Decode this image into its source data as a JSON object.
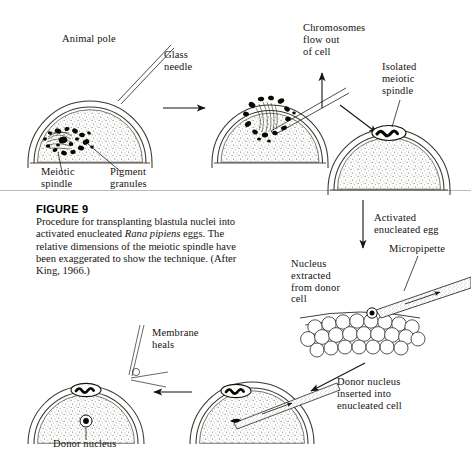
{
  "figure": {
    "title": "FIGURE 9",
    "caption_part1": "Procedure for transplanting blastula nuclei into activated enucleated ",
    "caption_italic1": "Rana",
    "caption_part2": " ",
    "caption_italic2": "pipiens",
    "caption_part3": " eggs. The relative dimensions of the meiotic spindle have been exaggerated to show the technique. (After King, 1966.)"
  },
  "labels": {
    "animal_pole": "Animal pole",
    "glass_needle": "Glass\nneedle",
    "meiotic_spindle": "Meiotic\nspindle",
    "pigment_granules": "Pigment\ngranules",
    "chromosomes_flow_out": "Chromosomes\nflow out\nof cell",
    "isolated_meiotic_spindle": "Isolated\nmeiotic\nspindle",
    "activated_enucleated_egg": "Activated\nenucleated egg",
    "micropipette": "Micropipette",
    "nucleus_extracted": "Nucleus\nextracted\nfrom donor\ncell",
    "donor_nucleus_inserted": "Donor nucleus\ninserted into\nenucleated cell",
    "membrane_heals": "Membrane\nheals",
    "donor_nucleus": "Donor nucleus"
  },
  "colors": {
    "ink": "#15120f",
    "line": "#2a2622",
    "rule": "#b9b4ad",
    "cytoplasm": "#9c968e",
    "page_bg": "#ffffff"
  },
  "diagram": {
    "type": "scientific-procedure-schematic",
    "steps": [
      {
        "id": 1,
        "name": "egg-with-meiotic-spindle",
        "note": "Animal pole of egg; meiotic spindle and pigment granules at left; glass needle approaching"
      },
      {
        "id": 2,
        "name": "needle-inserted-chromosomes-released",
        "note": "Glass needle inserted, chromosomes flow out of cell"
      },
      {
        "id": 3,
        "name": "enucleated-activated-egg",
        "note": "Isolated meiotic spindle sits outside; egg is activated and enucleated"
      },
      {
        "id": 4,
        "name": "donor-blastula-nucleus-extraction",
        "note": "Micropipette draws a nucleus from a donor blastula cell"
      },
      {
        "id": 5,
        "name": "nucleus-injected",
        "note": "Donor nucleus inserted into enucleated cell via micropipette"
      },
      {
        "id": 6,
        "name": "membrane-heals",
        "note": "Needle withdrawn, membrane heals, donor nucleus inside egg"
      }
    ]
  }
}
